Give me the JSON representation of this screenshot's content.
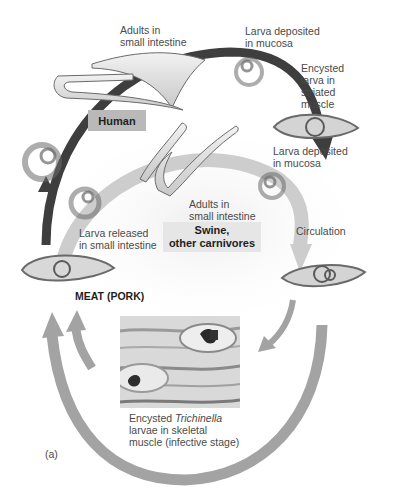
{
  "figure_label": "(a)",
  "hosts": {
    "human": "Human",
    "swine_line1": "Swine,",
    "swine_line2": "other carnivores"
  },
  "labels": {
    "adults_human": [
      "Adults in",
      "small intestine"
    ],
    "larva_mucosa_top": [
      "Larva deposited",
      "in mucosa"
    ],
    "encysted_striated": [
      "Encysted",
      "larva in",
      "striated",
      "muscle"
    ],
    "larva_mucosa_mid": [
      "Larva deposited",
      "in mucosa"
    ],
    "adults_swine": [
      "Adults in",
      "small intestine"
    ],
    "larva_released": [
      "Larva released",
      "in small intestine"
    ],
    "circulation": "Circulation",
    "meat": "MEAT (PORK)",
    "caption_line1_pre": "Encysted ",
    "caption_line1_italic": "Trichinella",
    "caption_line2": "larvae in skeletal",
    "caption_line3": "muscle (infective stage)"
  },
  "colors": {
    "dark_arrow": "#3b3b3b",
    "light_arrow": "#c9c9c9",
    "outer_arrow": "#9e9e9e",
    "human_box": "#b9b9b9",
    "swine_box": "#e6e6e6"
  }
}
